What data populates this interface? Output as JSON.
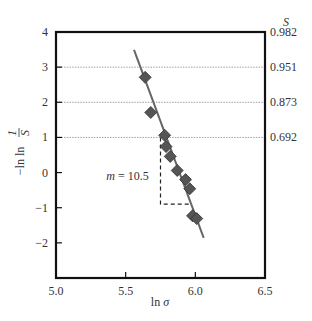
{
  "chart_data": {
    "type": "scatter",
    "title": "",
    "xlabel": "ln σ",
    "ylabel": "−ln ln 1/S",
    "y2label": "S",
    "xlim": [
      5.0,
      6.5
    ],
    "ylim": [
      -3,
      4
    ],
    "x_ticks": [
      5.0,
      5.5,
      6.0,
      6.5
    ],
    "x_tick_labels": [
      "5.0",
      "5.5",
      "6.0",
      "6.5"
    ],
    "y_ticks": [
      -2,
      -1,
      0,
      1,
      2,
      3,
      4
    ],
    "y_tick_labels": [
      "−2",
      "−1",
      "0",
      "1",
      "2",
      "3",
      "4"
    ],
    "y2_ticks": [
      1,
      2,
      3,
      4
    ],
    "y2_tick_labels": [
      "0.692",
      "0.873",
      "0.951",
      "0.982"
    ],
    "gridlines_y": [
      1,
      2,
      3
    ],
    "series": [
      {
        "name": "data",
        "marker": "diamond",
        "color": "#555555",
        "x": [
          5.64,
          5.68,
          5.78,
          5.79,
          5.82,
          5.87,
          5.93,
          5.96,
          5.98,
          6.01
        ],
        "y": [
          2.71,
          1.71,
          1.06,
          0.74,
          0.46,
          0.06,
          -0.2,
          -0.46,
          -1.23,
          -1.31
        ]
      }
    ],
    "fit_line": {
      "x": [
        5.56,
        6.06
      ],
      "y": [
        3.49,
        -1.86
      ],
      "color": "#666666"
    },
    "annotations": [
      {
        "text_var": "m",
        "text_val": " = 10.5",
        "x": 5.68,
        "y": -0.1
      }
    ],
    "slope_triangle": {
      "x_start": 5.75,
      "x_end": 5.96,
      "y_top": 1.0,
      "y_bottom": -0.9
    }
  }
}
